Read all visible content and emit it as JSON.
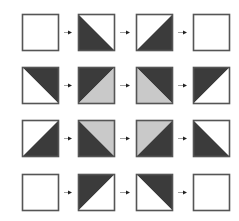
{
  "diagram": {
    "width": 239,
    "height": 221,
    "colors": {
      "dark": "#3b3b3b",
      "light": "#c9c9c9",
      "white": "#ffffff",
      "border": "#555555",
      "arrow": "#222222"
    },
    "columns_x": [
      22,
      78,
      136,
      193
    ],
    "rows_y": [
      14,
      67,
      120,
      174
    ],
    "cell_size": 37,
    "legend": {
      "diag_tlbr": "diagonal from top-left to bottom-right",
      "diag_bltr": "diagonal from bottom-left to top-right",
      "fills": "upper/lower triangle fill: dark, light, white"
    },
    "rows": [
      {
        "cells": [
          {
            "type": "blank"
          },
          {
            "type": "split",
            "diagonal": "tlbr",
            "upper": "white",
            "lower": "dark"
          },
          {
            "type": "split",
            "diagonal": "bltr",
            "upper": "white",
            "lower": "dark"
          },
          {
            "type": "blank"
          }
        ]
      },
      {
        "cells": [
          {
            "type": "split",
            "diagonal": "tlbr",
            "upper": "dark",
            "lower": "white"
          },
          {
            "type": "split",
            "diagonal": "bltr",
            "upper": "dark",
            "lower": "light"
          },
          {
            "type": "split",
            "diagonal": "tlbr",
            "upper": "dark",
            "lower": "light"
          },
          {
            "type": "split",
            "diagonal": "bltr",
            "upper": "dark",
            "lower": "white"
          }
        ]
      },
      {
        "cells": [
          {
            "type": "split",
            "diagonal": "bltr",
            "upper": "white",
            "lower": "dark"
          },
          {
            "type": "split",
            "diagonal": "tlbr",
            "upper": "light",
            "lower": "dark"
          },
          {
            "type": "split",
            "diagonal": "bltr",
            "upper": "light",
            "lower": "dark"
          },
          {
            "type": "split",
            "diagonal": "tlbr",
            "upper": "white",
            "lower": "dark"
          }
        ]
      },
      {
        "cells": [
          {
            "type": "blank"
          },
          {
            "type": "split",
            "diagonal": "bltr",
            "upper": "dark",
            "lower": "white"
          },
          {
            "type": "split",
            "diagonal": "tlbr",
            "upper": "dark",
            "lower": "white"
          },
          {
            "type": "blank"
          }
        ]
      }
    ],
    "arrows_per_row": 3
  }
}
